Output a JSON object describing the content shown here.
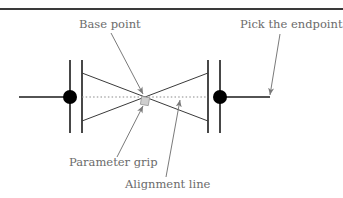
{
  "diagram": {
    "labels": {
      "base_point": "Base point",
      "pick_endpoint": "Pick the endpoint",
      "parameter_grip": "Parameter grip",
      "alignment_line": "Alignment line"
    },
    "colors": {
      "line": "#1a1a1a",
      "rule": "#3a3a3a",
      "leader": "#7a7a7a",
      "text": "#6b6b6b",
      "grip": "#c8c8c8",
      "dotted": "#8a8a8a"
    }
  }
}
